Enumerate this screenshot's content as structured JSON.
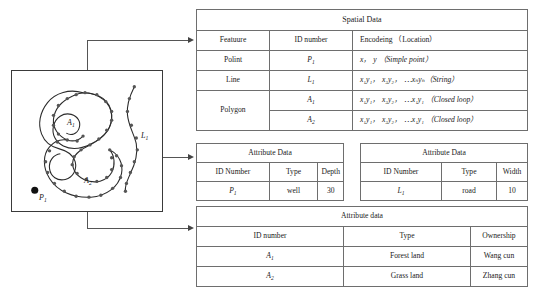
{
  "map": {
    "label_area_1": "A",
    "label_area_1_sub": "1",
    "label_area_2": "A",
    "label_area_2_sub": "2",
    "label_line": "L",
    "label_line_sub": "1",
    "label_point": "P",
    "label_point_sub": "1",
    "stroke_color": "#2b2b2b",
    "vertex_color": "#555555",
    "border_color": "#3a3a3a"
  },
  "spatial_table": {
    "title": "Spatial Data",
    "headers": [
      "Featuure",
      "ID number",
      "Encodeing （Location）"
    ],
    "rows": [
      {
        "feature": "Polint",
        "id": "P",
        "id_sub": "1",
        "encoding": "x， y （Simple point）"
      },
      {
        "feature": "Line",
        "id": "L",
        "id_sub": "1",
        "encoding": "x₁y₁， x₂y₂， ⋯xₙyₙ（String）"
      },
      {
        "feature": "Polygon",
        "id": "A",
        "id_sub": "1",
        "encoding": "x₁y₁， x₂y₂， ⋯x₁y₁ （Closed loop）"
      },
      {
        "feature": "",
        "id": "A",
        "id_sub": "2",
        "encoding": "x₁y₁， x₂y₂， ⋯x₁y₁ （Closed loop）"
      }
    ]
  },
  "attr_left_table": {
    "title": "Attribute Data",
    "headers": [
      "ID Number",
      "Type",
      "Depth"
    ],
    "rows": [
      {
        "id": "P",
        "id_sub": "1",
        "type": "well",
        "value": "30"
      }
    ]
  },
  "attr_right_table": {
    "title": "Attribute Data",
    "headers": [
      "ID Number",
      "Type",
      "Width"
    ],
    "rows": [
      {
        "id": "L",
        "id_sub": "1",
        "type": "road",
        "value": "10"
      }
    ]
  },
  "attr_bottom_table": {
    "title": "Attribute data",
    "headers": [
      "ID number",
      "Type",
      "Ownership"
    ],
    "rows": [
      {
        "id": "A",
        "id_sub": "1",
        "type": "Forest land",
        "owner": "Wang cun"
      },
      {
        "id": "A",
        "id_sub": "2",
        "type": "Grass land",
        "owner": "Zhang cun"
      }
    ]
  }
}
